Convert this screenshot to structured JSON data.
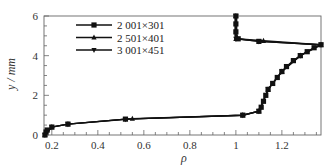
{
  "chart_data": {
    "type": "line",
    "title": "",
    "xlabel": "ρ",
    "ylabel": "y / mm",
    "xlim": [
      0.166,
      1.37
    ],
    "ylim": [
      0,
      6
    ],
    "x_ticks": [
      0.2,
      0.4,
      0.6,
      0.8,
      1.0,
      1.2
    ],
    "x_tick_labels": [
      "0.2",
      "0.4",
      "0.6",
      "0.8",
      "1",
      "1.2"
    ],
    "y_ticks": [
      0,
      2,
      4,
      6
    ],
    "y_tick_labels": [
      "0",
      "2",
      "4",
      "6"
    ],
    "grid": false,
    "legend_position": "upper-left",
    "series": [
      {
        "name": "2 001×301",
        "marker": "square",
        "points": [
          [
            0.17,
            0.0
          ],
          [
            0.175,
            0.15
          ],
          [
            0.18,
            0.25
          ],
          [
            0.2,
            0.4
          ],
          [
            0.27,
            0.55
          ],
          [
            0.52,
            0.8
          ],
          [
            1.03,
            1.0
          ],
          [
            1.1,
            1.2
          ],
          [
            1.11,
            1.4
          ],
          [
            1.12,
            1.7
          ],
          [
            1.13,
            2.0
          ],
          [
            1.14,
            2.3
          ],
          [
            1.16,
            2.6
          ],
          [
            1.18,
            2.9
          ],
          [
            1.2,
            3.2
          ],
          [
            1.22,
            3.45
          ],
          [
            1.25,
            3.75
          ],
          [
            1.28,
            4.0
          ],
          [
            1.31,
            4.2
          ],
          [
            1.34,
            4.4
          ],
          [
            1.37,
            4.55
          ],
          [
            1.1,
            4.72
          ],
          [
            1.01,
            4.85
          ],
          [
            1.0,
            5.2
          ],
          [
            1.0,
            5.6
          ],
          [
            1.0,
            6.0
          ]
        ]
      },
      {
        "name": "2 501×401",
        "marker": "triangle-up",
        "points": [
          [
            0.17,
            0.0
          ],
          [
            0.2,
            0.4
          ],
          [
            0.27,
            0.55
          ],
          [
            0.55,
            0.82
          ],
          [
            1.03,
            1.0
          ],
          [
            1.1,
            1.2
          ],
          [
            1.14,
            2.3
          ],
          [
            1.2,
            3.2
          ],
          [
            1.28,
            4.0
          ],
          [
            1.37,
            4.55
          ],
          [
            1.12,
            4.75
          ],
          [
            1.0,
            4.85
          ],
          [
            1.0,
            6.0
          ]
        ]
      },
      {
        "name": "3 001×451",
        "marker": "triangle-down",
        "points": [
          [
            0.17,
            0.0
          ],
          [
            0.2,
            0.4
          ],
          [
            0.27,
            0.55
          ],
          [
            0.52,
            0.8
          ],
          [
            1.03,
            1.0
          ],
          [
            1.1,
            1.2
          ],
          [
            1.14,
            2.3
          ],
          [
            1.2,
            3.2
          ],
          [
            1.28,
            4.0
          ],
          [
            1.37,
            4.55
          ],
          [
            1.1,
            4.72
          ],
          [
            1.0,
            4.85
          ],
          [
            1.0,
            6.0
          ]
        ]
      }
    ]
  },
  "axes": {
    "x_title": "ρ",
    "y_title": "y / mm"
  },
  "legend": {
    "items": [
      {
        "label": "2 001×301",
        "marker": "square"
      },
      {
        "label": "2 501×401",
        "marker": "triangle-up"
      },
      {
        "label": "3 001×451",
        "marker": "triangle-down"
      }
    ]
  }
}
